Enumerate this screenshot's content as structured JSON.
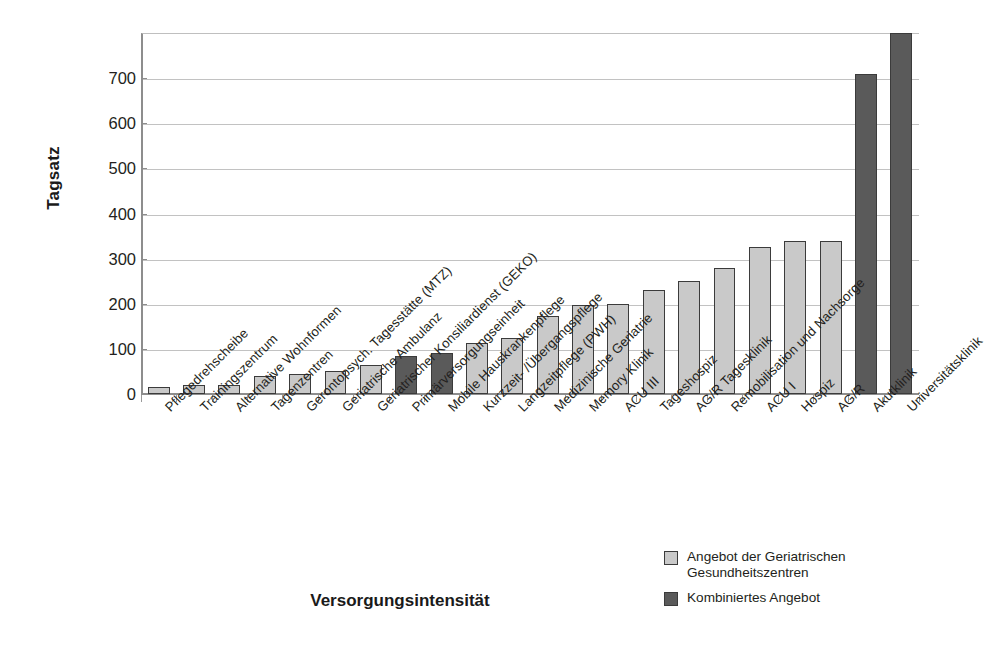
{
  "chart_data": {
    "type": "bar",
    "title": "",
    "xlabel": "Versorgungsintensität",
    "ylabel": "Tagsatz",
    "ylim": [
      0,
      800
    ],
    "ytick_labels": [
      "0",
      "100",
      "200",
      "300",
      "400",
      "500",
      "600",
      "700"
    ],
    "yticks": [
      0,
      100,
      200,
      300,
      400,
      500,
      600,
      700
    ],
    "grid": true,
    "legend_position": "bottom-right",
    "categories": [
      "Pflegedrehscheibe",
      "Trainingszentrum",
      "Alternative Wohnformen",
      "Tagenzentren",
      "Gerontopsych. Tagesstätte (MTZ)",
      "Geriatrische Ambulanz",
      "Geriatrischer Konsiliardienst (GEKO)",
      "Primärversorgungseinheit",
      "Mobile Hauskrankenpflege",
      "Kurzzeit- /Übergangspflege",
      "Langzeitpflege (PWH)",
      "Medizinische Geriatrie",
      "Memory Klinik",
      "ACU III",
      "Tageshospiz",
      "AG/R Tagesklinik",
      "Remobilisation und Nachsorge",
      "ACU I",
      "Hospiz",
      "AG/R",
      "Akutklinik",
      "Universitätsklinik"
    ],
    "values": [
      15,
      20,
      20,
      40,
      45,
      50,
      65,
      85,
      90,
      112,
      124,
      172,
      197,
      200,
      230,
      250,
      280,
      325,
      340,
      340,
      710,
      800
    ],
    "bar_groups": [
      "light",
      "light",
      "light",
      "light",
      "light",
      "light",
      "light",
      "dark",
      "dark",
      "light",
      "light",
      "light",
      "light",
      "light",
      "light",
      "light",
      "light",
      "light",
      "light",
      "light",
      "dark",
      "dark"
    ],
    "series": [
      {
        "name": "Angebot der Geriatrischen Gesundheitszentren",
        "color": "#c9c9c9"
      },
      {
        "name": "Kombiniertes Angebot",
        "color": "#5a5a5a"
      }
    ],
    "legend": [
      {
        "label": "Angebot der Geriatrischen Gesundheitszentren",
        "swatch": "light",
        "color": "#c9c9c9"
      },
      {
        "label": "Kombiniertes Angebot",
        "swatch": "dark",
        "color": "#5a5a5a"
      }
    ]
  },
  "axis": {
    "y_title": "Tagsatz",
    "x_title": "Versorgungsintensität"
  },
  "colors": {
    "light_bar": "#c9c9c9",
    "dark_bar": "#5a5a5a",
    "bar_outline": "#3b3b3b",
    "gridline": "#c2c2c2",
    "axis": "#8d8d8d",
    "text": "#231f20",
    "background": "#ffffff"
  }
}
